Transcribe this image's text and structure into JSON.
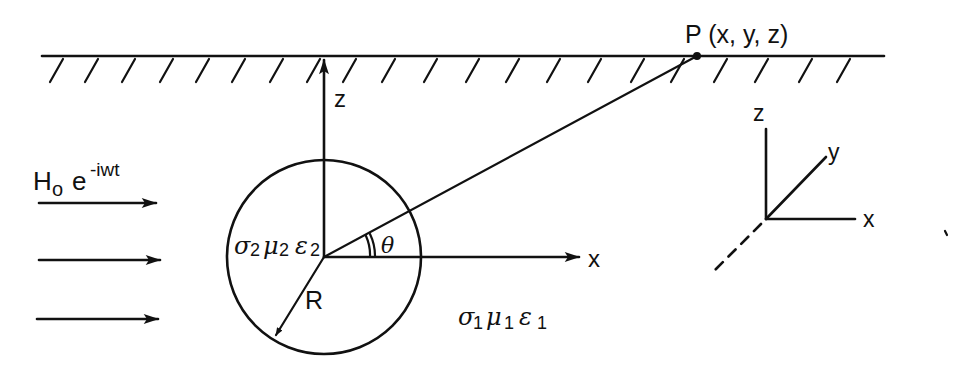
{
  "figure": {
    "point_label": "P (x, y, z)",
    "incident_field": {
      "base": "H",
      "base_subscript": "o",
      "exp_base": "e",
      "exp_superscript": "-iwt",
      "arrow_count": 3
    },
    "sphere": {
      "properties_label": {
        "sigma": "σ",
        "sigma_sub": "2",
        "mu": "μ",
        "mu_sub": "2",
        "eps": "ε",
        "eps_sub": "2"
      },
      "radius_label": "R",
      "angle_label": "θ"
    },
    "host_medium_label": {
      "sigma": "σ",
      "sigma_sub": "1",
      "mu": "μ",
      "mu_sub": "1",
      "eps": "ε",
      "eps_sub": "1"
    },
    "main_axes": {
      "z_label": "z",
      "x_label": "x"
    },
    "reference_axes": {
      "z_label": "z",
      "y_label": "y",
      "x_label": "x"
    }
  }
}
